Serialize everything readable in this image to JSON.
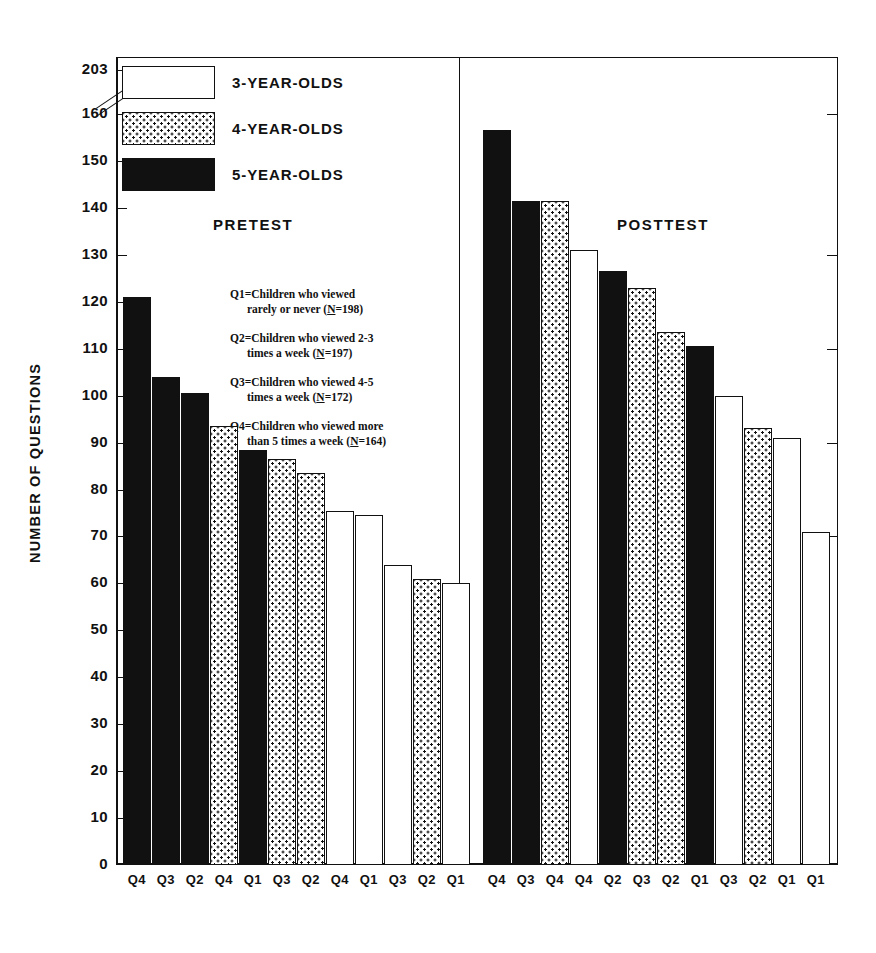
{
  "chart_data": {
    "type": "bar",
    "title": "",
    "xlabel": "",
    "ylabel": "NUMBER OF QUESTIONS",
    "ylim": [
      0,
      160
    ],
    "y_break_top_label": "203",
    "ytick_labels": [
      "203",
      "160",
      "150",
      "140",
      "130",
      "120",
      "110",
      "100",
      "90",
      "80",
      "70",
      "60",
      "50",
      "40",
      "30",
      "20",
      "10",
      "0"
    ],
    "yticks": [
      203,
      160,
      150,
      140,
      130,
      120,
      110,
      100,
      90,
      80,
      70,
      60,
      50,
      40,
      30,
      20,
      10,
      0
    ],
    "grid": false,
    "legend_position": "top-left",
    "legend": [
      {
        "label": "3-YEAR-OLDS",
        "fill": "white"
      },
      {
        "label": "4-YEAR-OLDS",
        "fill": "dotted"
      },
      {
        "label": "5-YEAR-OLDS",
        "fill": "black"
      }
    ],
    "panels": [
      {
        "name": "PRETEST",
        "categories": [
          "Q4",
          "Q3",
          "Q2",
          "Q4",
          "Q1",
          "Q3",
          "Q2",
          "Q4",
          "Q1",
          "Q3",
          "Q2",
          "Q1"
        ],
        "groups": [
          "5-YEAR-OLDS",
          "5-YEAR-OLDS",
          "5-YEAR-OLDS",
          "4-YEAR-OLDS",
          "5-YEAR-OLDS",
          "4-YEAR-OLDS",
          "4-YEAR-OLDS",
          "3-YEAR-OLDS",
          "3-YEAR-OLDS",
          "3-YEAR-OLDS",
          "4-YEAR-OLDS",
          "3-YEAR-OLDS"
        ],
        "values": [
          121,
          104,
          100.5,
          93.5,
          88.5,
          86.5,
          83.5,
          75.5,
          74.5,
          64,
          61,
          60
        ]
      },
      {
        "name": "POSTTEST",
        "categories": [
          "Q4",
          "Q3",
          "Q4",
          "Q4",
          "Q2",
          "Q3",
          "Q2",
          "Q1",
          "Q3",
          "Q2",
          "Q1",
          "Q1"
        ],
        "groups": [
          "5-YEAR-OLDS",
          "5-YEAR-OLDS",
          "4-YEAR-OLDS",
          "3-YEAR-OLDS",
          "5-YEAR-OLDS",
          "4-YEAR-OLDS",
          "4-YEAR-OLDS",
          "5-YEAR-OLDS",
          "3-YEAR-OLDS",
          "4-YEAR-OLDS",
          "3-YEAR-OLDS",
          "3-YEAR-OLDS"
        ],
        "values": [
          156.5,
          141.5,
          141.5,
          131,
          126.5,
          123,
          113.5,
          110.5,
          100,
          93,
          91,
          71
        ]
      }
    ],
    "annotations": [
      {
        "id": "Q1",
        "line1": "Q1=Children who viewed",
        "line2": "rarely or never (N=198)",
        "n": 198
      },
      {
        "id": "Q2",
        "line1": "Q2=Children who viewed 2-3",
        "line2": "times a week (N=197)",
        "n": 197
      },
      {
        "id": "Q3",
        "line1": "Q3=Children who viewed 4-5",
        "line2": "times a week (N=172)",
        "n": 172
      },
      {
        "id": "Q4",
        "line1": "Q4=Children who viewed more",
        "line2": "than 5 times a week (N=164)",
        "n": 164
      }
    ]
  },
  "colors": {
    "ink": "#111111",
    "paper": "#ffffff"
  }
}
